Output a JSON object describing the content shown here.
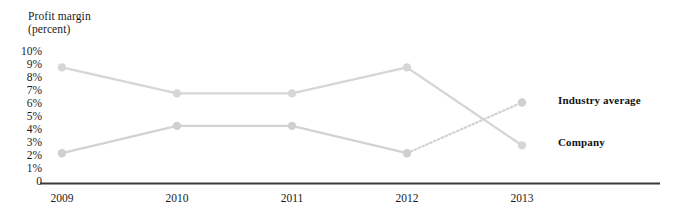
{
  "chart_data": {
    "type": "line",
    "title": "",
    "ylabel": "Profit margin (percent)",
    "ylabel_line1": "Profit margin",
    "ylabel_line2": "(percent)",
    "xlabel": "",
    "categories": [
      "2009",
      "2010",
      "2011",
      "2012",
      "2013"
    ],
    "ytick_labels": [
      "10%",
      "9%",
      "8%",
      "7%",
      "6%",
      "5%",
      "4%",
      "3%",
      "2%",
      "1%",
      "0"
    ],
    "ytick_values": [
      10,
      9,
      8,
      7,
      6,
      5,
      4,
      3,
      2,
      1,
      0
    ],
    "ylim": [
      0,
      10
    ],
    "grid": false,
    "legend_position": "right-inline",
    "series": [
      {
        "name": "Industry average",
        "values": [
          8.7,
          6.7,
          6.7,
          8.7,
          2.7
        ],
        "color": "#d6d6d6",
        "final_segment_style": "solid",
        "note": "descends from 2012 peak crossing below the company line into 2013"
      },
      {
        "name": "Company",
        "values": [
          2.1,
          4.2,
          4.2,
          2.1,
          6.0
        ],
        "color": "#cfcfcf",
        "final_segment_style": "dotted",
        "note": "projected rise from 2012 crossing above the industry line into 2013"
      }
    ],
    "label_industry_average": "Industry average",
    "label_company": "Company",
    "axis_color": "#3a3a3a",
    "line_color": "#d6d6d6",
    "marker_color": "#cccccc"
  }
}
